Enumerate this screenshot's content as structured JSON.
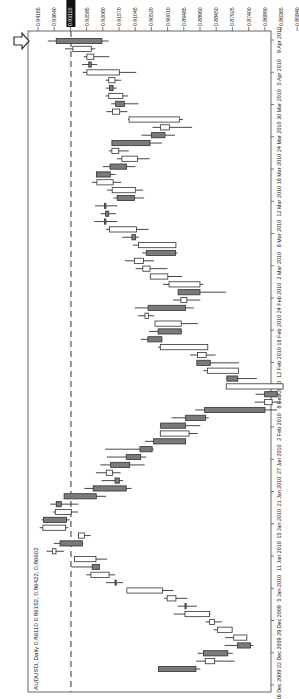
{
  "chart_data": {
    "type": "candlestick",
    "orientation": "rotated-90-clockwise",
    "title": "AUDUSD, Daily 0.86110 0.86152, 0.86422, 0.86602",
    "instrument": "AUDUSD",
    "timeframe": "Daily",
    "ohlc_header": [
      "0.86110",
      "0.86152",
      "0.86422",
      "0.86602"
    ],
    "price_axis": {
      "position": "top",
      "ticks": [
        "0.94165",
        "0.93640",
        "0.93110",
        "0.92585",
        "0.92060",
        "0.91570",
        "0.91045",
        "0.90520",
        "0.90010",
        "0.89485",
        "0.88960",
        "0.88450",
        "0.87925",
        "0.87400",
        "0.86890",
        "0.86365",
        "0.85840",
        "0.85330"
      ],
      "highlighted_tick": "0.93110",
      "range": [
        0.8533,
        0.94165
      ]
    },
    "date_axis": {
      "position": "right",
      "ticks": [
        "9 Apr 2010",
        "5 Apr 2010",
        "30 Mar 2010",
        "24 Mar 2010",
        "18 Mar 2010",
        "12 Mar 2010",
        "8 Mar 2010",
        "2 Mar 2010",
        "24 Feb 2010",
        "18 Feb 2010",
        "12 Feb 2010",
        "8 Feb 2010",
        "2 Feb 2010",
        "27 Jan 2010",
        "21 Jan 2010",
        "15 Jan 2010",
        "11 Jan 2010",
        "5 Jan 2010",
        "29 Dec 2009",
        "22 Dec 2009",
        "16 Dec 2009"
      ]
    },
    "reference_line": {
      "price": 0.9311,
      "style": "dashed"
    },
    "grid": false,
    "colors": {
      "bull_fill": "#ffffff",
      "bear_fill": "#7a7a7a",
      "outline": "#333333",
      "highlight_bg": "#111111",
      "highlight_text": "#ffffff"
    },
    "candles_newest_first": [
      {
        "o": 0.9358,
        "c": 0.9212,
        "h": 0.9385,
        "l": 0.919,
        "bear": true
      },
      {
        "o": 0.9305,
        "c": 0.9246,
        "h": 0.933,
        "l": 0.9233,
        "bear": false
      },
      {
        "o": 0.926,
        "c": 0.9238,
        "h": 0.927,
        "l": 0.9188,
        "bear": false
      },
      {
        "o": 0.9254,
        "c": 0.9246,
        "h": 0.9275,
        "l": 0.9227,
        "bear": true
      },
      {
        "o": 0.926,
        "c": 0.9156,
        "h": 0.9273,
        "l": 0.9102,
        "bear": false
      },
      {
        "o": 0.919,
        "c": 0.917,
        "h": 0.92,
        "l": 0.915,
        "bear": false
      },
      {
        "o": 0.9188,
        "c": 0.9176,
        "h": 0.9199,
        "l": 0.9165,
        "bear": true
      },
      {
        "o": 0.919,
        "c": 0.9145,
        "h": 0.92,
        "l": 0.9128,
        "bear": false
      },
      {
        "o": 0.9168,
        "c": 0.914,
        "h": 0.9182,
        "l": 0.9095,
        "bear": true
      },
      {
        "o": 0.9178,
        "c": 0.9155,
        "h": 0.9198,
        "l": 0.913,
        "bear": false
      },
      {
        "o": 0.9125,
        "c": 0.8964,
        "h": 0.9128,
        "l": 0.8953,
        "bear": false
      },
      {
        "o": 0.9024,
        "c": 0.8996,
        "h": 0.905,
        "l": 0.8923,
        "bear": false
      },
      {
        "o": 0.9053,
        "c": 0.901,
        "h": 0.9085,
        "l": 0.8978,
        "bear": true
      },
      {
        "o": 0.918,
        "c": 0.9058,
        "h": 0.918,
        "l": 0.902,
        "bear": true
      },
      {
        "o": 0.918,
        "c": 0.9158,
        "h": 0.919,
        "l": 0.9126,
        "bear": false
      },
      {
        "o": 0.9148,
        "c": 0.9098,
        "h": 0.9163,
        "l": 0.9059,
        "bear": false
      },
      {
        "o": 0.9186,
        "c": 0.9133,
        "h": 0.9209,
        "l": 0.9105,
        "bear": true
      },
      {
        "o": 0.9229,
        "c": 0.9185,
        "h": 0.9231,
        "l": 0.9168,
        "bear": true
      },
      {
        "o": 0.9228,
        "c": 0.9176,
        "h": 0.9244,
        "l": 0.915,
        "bear": false
      },
      {
        "o": 0.9179,
        "c": 0.9105,
        "h": 0.9195,
        "l": 0.908,
        "bear": false
      },
      {
        "o": 0.9163,
        "c": 0.9108,
        "h": 0.9175,
        "l": 0.9077,
        "bear": true
      },
      {
        "o": 0.9204,
        "c": 0.9199,
        "h": 0.9234,
        "l": 0.9163,
        "bear": true
      },
      {
        "o": 0.92,
        "c": 0.919,
        "h": 0.9216,
        "l": 0.9167,
        "bear": true
      },
      {
        "o": 0.9204,
        "c": 0.9199,
        "h": 0.9236,
        "l": 0.9162,
        "bear": true
      },
      {
        "o": 0.9188,
        "c": 0.9101,
        "h": 0.9199,
        "l": 0.9062,
        "bear": false
      },
      {
        "o": 0.9116,
        "c": 0.9104,
        "h": 0.9147,
        "l": 0.9094,
        "bear": true
      },
      {
        "o": 0.9095,
        "c": 0.8975,
        "h": 0.9113,
        "l": 0.8975,
        "bear": false
      },
      {
        "o": 0.907,
        "c": 0.8976,
        "h": 0.9083,
        "l": 0.897,
        "bear": true
      },
      {
        "o": 0.9108,
        "c": 0.9079,
        "h": 0.9138,
        "l": 0.9045,
        "bear": false
      },
      {
        "o": 0.9081,
        "c": 0.9058,
        "h": 0.9104,
        "l": 0.9002,
        "bear": false
      },
      {
        "o": 0.9057,
        "c": 0.9001,
        "h": 0.9057,
        "l": 0.8955,
        "bear": false
      },
      {
        "o": 0.8997,
        "c": 0.8898,
        "h": 0.9016,
        "l": 0.8887,
        "bear": false
      },
      {
        "o": 0.8968,
        "c": 0.8898,
        "h": 0.8968,
        "l": 0.8815,
        "bear": true
      },
      {
        "o": 0.8959,
        "c": 0.894,
        "h": 0.8984,
        "l": 0.8897,
        "bear": false
      },
      {
        "o": 0.9064,
        "c": 0.8944,
        "h": 0.9107,
        "l": 0.8918,
        "bear": true
      },
      {
        "o": 0.9074,
        "c": 0.9063,
        "h": 0.9096,
        "l": 0.9045,
        "bear": false
      },
      {
        "o": 0.9042,
        "c": 0.8958,
        "h": 0.9042,
        "l": 0.8904,
        "bear": false
      },
      {
        "o": 0.9032,
        "c": 0.8958,
        "h": 0.9061,
        "l": 0.8955,
        "bear": true
      },
      {
        "o": 0.9065,
        "c": 0.902,
        "h": 0.9087,
        "l": 0.9019,
        "bear": true
      },
      {
        "o": 0.9025,
        "c": 0.8873,
        "h": 0.9032,
        "l": 0.8873,
        "bear": false
      },
      {
        "o": 0.8906,
        "c": 0.8878,
        "h": 0.893,
        "l": 0.8848,
        "bear": false
      },
      {
        "o": 0.8908,
        "c": 0.8865,
        "h": 0.8908,
        "l": 0.8773,
        "bear": true
      },
      {
        "o": 0.8874,
        "c": 0.8775,
        "h": 0.8887,
        "l": 0.8775,
        "bear": false
      },
      {
        "o": 0.8812,
        "c": 0.8777,
        "h": 0.8815,
        "l": 0.8716,
        "bear": true
      },
      {
        "o": 0.8814,
        "c": 0.8632,
        "h": 0.8814,
        "l": 0.8632,
        "bear": false
      },
      {
        "o": 0.8691,
        "c": 0.8651,
        "h": 0.872,
        "l": 0.864,
        "bear": true
      },
      {
        "o": 0.8691,
        "c": 0.8667,
        "h": 0.8723,
        "l": 0.8637,
        "bear": false
      },
      {
        "o": 0.8883,
        "c": 0.869,
        "h": 0.8913,
        "l": 0.8651,
        "bear": true
      },
      {
        "o": 0.8944,
        "c": 0.888,
        "h": 0.8989,
        "l": 0.887,
        "bear": true
      },
      {
        "o": 0.9024,
        "c": 0.8944,
        "h": 0.9024,
        "l": 0.8897,
        "bear": true
      },
      {
        "o": 0.9025,
        "c": 0.8933,
        "h": 0.9025,
        "l": 0.8905,
        "bear": false
      },
      {
        "o": 0.9047,
        "c": 0.8944,
        "h": 0.9074,
        "l": 0.8944,
        "bear": true
      },
      {
        "o": 0.909,
        "c": 0.9051,
        "h": 0.9201,
        "l": 0.9046,
        "bear": true
      },
      {
        "o": 0.9134,
        "c": 0.9088,
        "h": 0.9196,
        "l": 0.907,
        "bear": true
      },
      {
        "o": 0.9184,
        "c": 0.9123,
        "h": 0.9217,
        "l": 0.9075,
        "bear": true
      },
      {
        "o": 0.9198,
        "c": 0.9178,
        "h": 0.9231,
        "l": 0.9152,
        "bear": false
      },
      {
        "o": 0.917,
        "c": 0.9156,
        "h": 0.9213,
        "l": 0.9144,
        "bear": true
      },
      {
        "o": 0.924,
        "c": 0.9134,
        "h": 0.9268,
        "l": 0.9117,
        "bear": true
      },
      {
        "o": 0.9333,
        "c": 0.923,
        "h": 0.9333,
        "l": 0.9198,
        "bear": true
      },
      {
        "o": 0.9358,
        "c": 0.9342,
        "h": 0.9377,
        "l": 0.9287,
        "bear": true
      },
      {
        "o": 0.9361,
        "c": 0.931,
        "h": 0.9368,
        "l": 0.9288,
        "bear": false
      },
      {
        "o": 0.9399,
        "c": 0.9325,
        "h": 0.9405,
        "l": 0.9315,
        "bear": true
      },
      {
        "o": 0.9401,
        "c": 0.9328,
        "h": 0.9411,
        "l": 0.932,
        "bear": false
      },
      {
        "o": 0.9287,
        "c": 0.9268,
        "h": 0.9289,
        "l": 0.9248,
        "bear": false
      },
      {
        "o": 0.9346,
        "c": 0.9274,
        "h": 0.9366,
        "l": 0.9272,
        "bear": true
      },
      {
        "o": 0.937,
        "c": 0.9359,
        "h": 0.9389,
        "l": 0.9333,
        "bear": false
      },
      {
        "o": 0.93,
        "c": 0.9231,
        "h": 0.93,
        "l": 0.9195,
        "bear": false
      },
      {
        "o": 0.9243,
        "c": 0.922,
        "h": 0.9309,
        "l": 0.922,
        "bear": true
      },
      {
        "o": 0.9247,
        "c": 0.9189,
        "h": 0.9262,
        "l": 0.917,
        "bear": false
      },
      {
        "o": 0.917,
        "c": 0.9166,
        "h": 0.9199,
        "l": 0.9144,
        "bear": true
      },
      {
        "o": 0.9132,
        "c": 0.9018,
        "h": 0.9132,
        "l": 0.8983,
        "bear": false
      },
      {
        "o": 0.9003,
        "c": 0.8975,
        "h": 0.9012,
        "l": 0.8938,
        "bear": false
      },
      {
        "o": 0.8946,
        "c": 0.8944,
        "h": 0.8969,
        "l": 0.8908,
        "bear": true
      },
      {
        "o": 0.8946,
        "c": 0.8867,
        "h": 0.8982,
        "l": 0.8864,
        "bear": false
      },
      {
        "o": 0.8867,
        "c": 0.8852,
        "h": 0.888,
        "l": 0.8828,
        "bear": false
      },
      {
        "o": 0.8842,
        "c": 0.8795,
        "h": 0.8854,
        "l": 0.8795,
        "bear": false
      },
      {
        "o": 0.879,
        "c": 0.8748,
        "h": 0.8817,
        "l": 0.8747,
        "bear": false
      },
      {
        "o": 0.8778,
        "c": 0.8736,
        "h": 0.8819,
        "l": 0.8727,
        "bear": true
      },
      {
        "o": 0.8887,
        "c": 0.8809,
        "h": 0.8905,
        "l": 0.8793,
        "bear": true
      },
      {
        "o": 0.8881,
        "c": 0.8851,
        "h": 0.891,
        "l": 0.8787,
        "bear": false
      },
      {
        "o": 0.9031,
        "c": 0.8911,
        "h": 0.9031,
        "l": 0.8897,
        "bear": true
      }
    ]
  },
  "chart_labels": {
    "title": "AUDUSD, Daily 0.86110 0.86152, 0.86422, 0.86602"
  }
}
